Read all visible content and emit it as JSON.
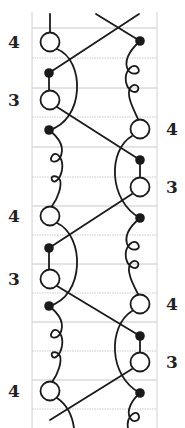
{
  "diagram": {
    "type": "footwork-notation",
    "colors": {
      "stroke": "#1a1a1a",
      "grid": "#c8c8c8",
      "label": "#222222",
      "background": "#ffffff"
    },
    "frame": {
      "left": 32,
      "right": 157,
      "top": 12,
      "bottom": 428
    },
    "gridlines": [
      28,
      58,
      88,
      117,
      147,
      177,
      206,
      235,
      264,
      293,
      322,
      351,
      380,
      409
    ],
    "left_labels": [
      {
        "text": "4",
        "y": 42
      },
      {
        "text": "3",
        "y": 100
      },
      {
        "text": "4",
        "y": 216
      },
      {
        "text": "3",
        "y": 279
      },
      {
        "text": "4",
        "y": 391
      }
    ],
    "right_labels": [
      {
        "text": "4",
        "y": 129
      },
      {
        "text": "3",
        "y": 187
      },
      {
        "text": "4",
        "y": 304
      },
      {
        "text": "3",
        "y": 362
      }
    ],
    "left_circles": [
      42,
      100,
      216,
      279,
      391
    ],
    "left_dots": [
      73,
      130,
      248,
      306
    ],
    "right_circles": [
      129,
      187,
      304,
      362
    ],
    "right_dots": [
      41,
      160,
      218,
      336,
      393
    ]
  }
}
